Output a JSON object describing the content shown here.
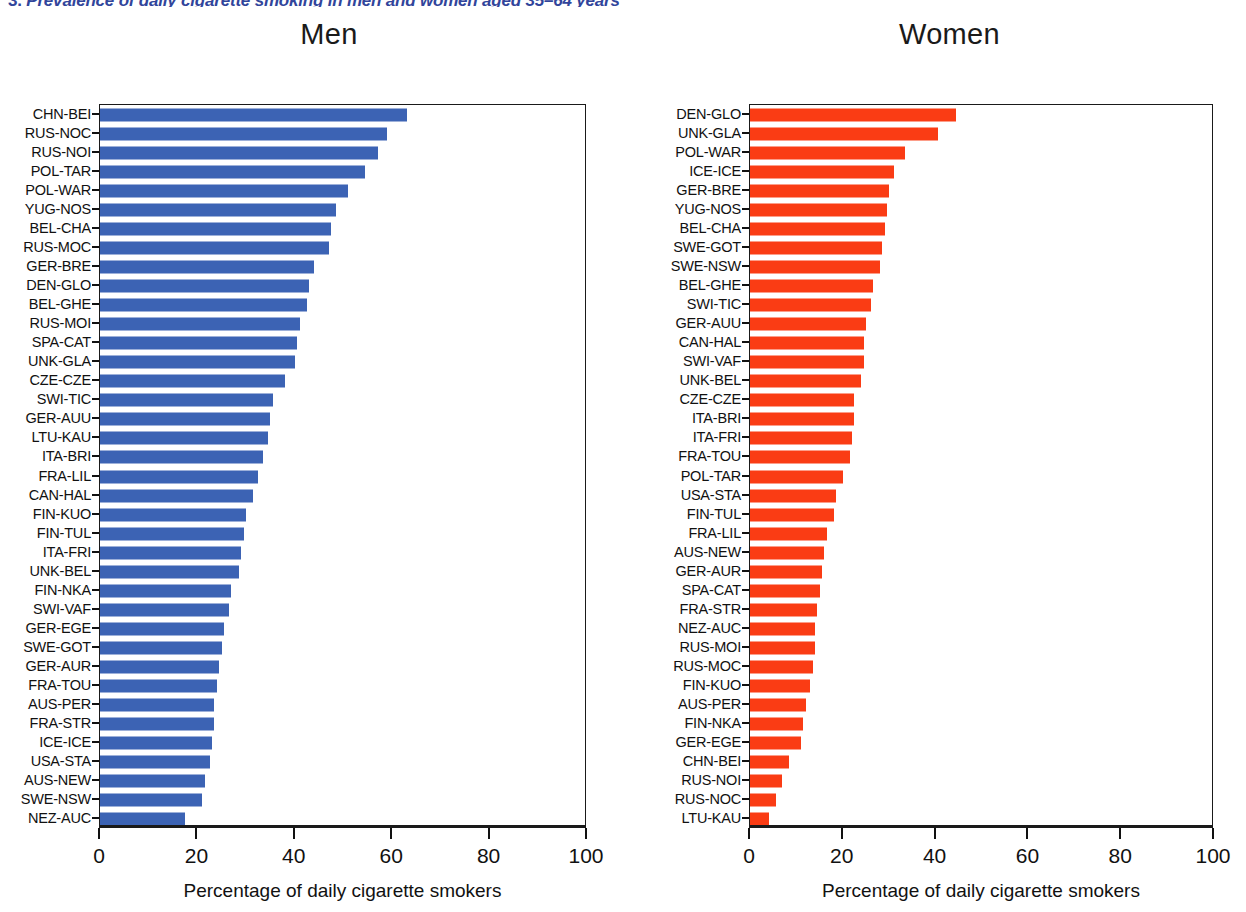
{
  "figure": {
    "caption_number": "3.",
    "caption_text": "Prevalence of daily cigarette smoking in men and women aged 35–64 years"
  },
  "axis": {
    "ticks": [
      0,
      20,
      40,
      60,
      80,
      100
    ],
    "tick_labels": [
      "0",
      "20",
      "40",
      "60",
      "80",
      "100"
    ],
    "xlabel": "Percentage of daily cigarette smokers",
    "xmin": 0,
    "xmax": 100
  },
  "colors": {
    "men_bar": "#3c63b4",
    "women_bar": "#fa3c14",
    "axis": "#1a1a1a",
    "text": "#111111",
    "caption": "#31459b",
    "background": "#ffffff"
  },
  "chart_data": [
    {
      "type": "bar",
      "orientation": "horizontal",
      "title": "Men",
      "xlabel": "Percentage of daily cigarette smokers",
      "ylabel": "",
      "xlim": [
        0,
        100
      ],
      "grid": false,
      "legend": "none",
      "color": "#3c63b4",
      "categories": [
        "CHN-BEI",
        "RUS-NOC",
        "RUS-NOI",
        "POL-TAR",
        "POL-WAR",
        "YUG-NOS",
        "BEL-CHA",
        "RUS-MOC",
        "GER-BRE",
        "DEN-GLO",
        "BEL-GHE",
        "RUS-MOI",
        "SPA-CAT",
        "UNK-GLA",
        "CZE-CZE",
        "SWI-TIC",
        "GER-AUU",
        "LTU-KAU",
        "ITA-BRI",
        "FRA-LIL",
        "CAN-HAL",
        "FIN-KUO",
        "FIN-TUL",
        "ITA-FRI",
        "UNK-BEL",
        "FIN-NKA",
        "SWI-VAF",
        "GER-EGE",
        "SWE-GOT",
        "GER-AUR",
        "FRA-TOU",
        "AUS-PER",
        "FRA-STR",
        "ICE-ICE",
        "USA-STA",
        "AUS-NEW",
        "SWE-NSW",
        "NEZ-AUC"
      ],
      "values": [
        63.0,
        59.0,
        57.0,
        54.5,
        51.0,
        48.5,
        47.5,
        47.0,
        44.0,
        43.0,
        42.5,
        41.0,
        40.5,
        40.0,
        38.0,
        35.5,
        35.0,
        34.5,
        33.5,
        32.5,
        31.5,
        30.0,
        29.5,
        29.0,
        28.5,
        27.0,
        26.5,
        25.5,
        25.0,
        24.5,
        24.0,
        23.5,
        23.5,
        23.0,
        22.5,
        21.5,
        21.0,
        17.5
      ]
    },
    {
      "type": "bar",
      "orientation": "horizontal",
      "title": "Women",
      "xlabel": "Percentage of daily cigarette smokers",
      "ylabel": "",
      "xlim": [
        0,
        100
      ],
      "grid": false,
      "legend": "none",
      "color": "#fa3c14",
      "categories": [
        "DEN-GLO",
        "UNK-GLA",
        "POL-WAR",
        "ICE-ICE",
        "GER-BRE",
        "YUG-NOS",
        "BEL-CHA",
        "SWE-GOT",
        "SWE-NSW",
        "BEL-GHE",
        "SWI-TIC",
        "GER-AUU",
        "CAN-HAL",
        "SWI-VAF",
        "UNK-BEL",
        "CZE-CZE",
        "ITA-BRI",
        "ITA-FRI",
        "FRA-TOU",
        "POL-TAR",
        "USA-STA",
        "FIN-TUL",
        "FRA-LIL",
        "AUS-NEW",
        "GER-AUR",
        "SPA-CAT",
        "FRA-STR",
        "NEZ-AUC",
        "RUS-MOI",
        "RUS-MOC",
        "FIN-KUO",
        "AUS-PER",
        "FIN-NKA",
        "GER-EGE",
        "CHN-BEI",
        "RUS-NOI",
        "RUS-NOC",
        "LTU-KAU"
      ],
      "values": [
        44.5,
        40.5,
        33.5,
        31.0,
        30.0,
        29.5,
        29.0,
        28.5,
        28.0,
        26.5,
        26.0,
        25.0,
        24.5,
        24.5,
        24.0,
        22.5,
        22.5,
        22.0,
        21.5,
        20.0,
        18.5,
        18.0,
        16.5,
        16.0,
        15.5,
        15.0,
        14.5,
        14.0,
        14.0,
        13.5,
        13.0,
        12.0,
        11.5,
        11.0,
        8.5,
        7.0,
        5.5,
        4.0
      ]
    }
  ]
}
